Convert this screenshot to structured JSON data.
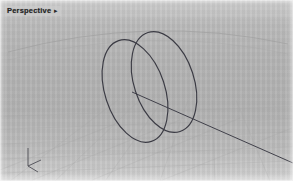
{
  "viewport": {
    "label": "Perspective",
    "caret_glyph": "▸",
    "background_color": "#b5b5b5",
    "wire_color": "#3a3a42",
    "grid_color": "#a8a8a8"
  },
  "scene": {
    "objects": [
      {
        "name": "cylinder-back-rim",
        "type": "ellipse",
        "cx": 135,
        "cy": 91,
        "rx": 30,
        "ry": 53,
        "rotation_deg": -18
      },
      {
        "name": "cylinder-front-rim",
        "type": "ellipse",
        "cx": 164,
        "cy": 82,
        "rx": 30,
        "ry": 52,
        "rotation_deg": -18
      },
      {
        "name": "construction-line",
        "type": "line",
        "x1": 132,
        "y1": 92,
        "x2": 293,
        "y2": 163
      },
      {
        "name": "horizon-arc",
        "type": "arc"
      }
    ],
    "axis_gizmo": {
      "name": "axis-indicator",
      "x": 27,
      "y": 154,
      "axes": [
        "x",
        "y",
        "z"
      ]
    }
  }
}
